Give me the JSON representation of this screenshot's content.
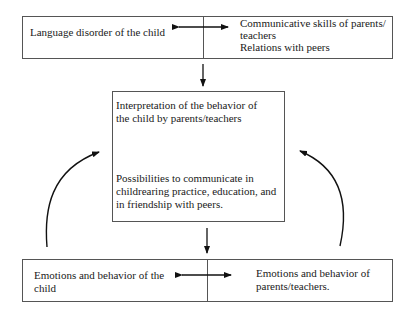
{
  "diagram": {
    "top_box": {
      "left": "Language disorder of the child",
      "right_line1": "Communicative skills of parents/",
      "right_line2": "teachers",
      "right_line3": "Relations with peers"
    },
    "middle_box": {
      "top_line1": "Interpretation of the behavior of",
      "top_line2": "the child by parents/teachers",
      "bottom_line1": "Possibilities to communicate in",
      "bottom_line2": "childrearing practice, education, and",
      "bottom_line3": "in friendship with peers."
    },
    "bottom_box": {
      "left_line1": "Emotions and behavior of the",
      "left_line2": "child",
      "right_line1": "Emotions and behavior of",
      "right_line2": "parents/teachers."
    },
    "arrows": [
      {
        "id": "top-bidirectional",
        "type": "double-headed",
        "from": "Language disorder of the child",
        "to": "Communicative skills of parents/teachers"
      },
      {
        "id": "top-to-middle",
        "type": "down"
      },
      {
        "id": "middle-to-bottom",
        "type": "down"
      },
      {
        "id": "bottom-bidirectional",
        "type": "double-headed",
        "from": "Emotions and behavior of the child",
        "to": "Emotions and behavior of parents/teachers."
      },
      {
        "id": "left-feedback",
        "type": "curved",
        "from": "Emotions and behavior of the child",
        "to": "middle box"
      },
      {
        "id": "right-feedback",
        "type": "curved",
        "from": "Emotions and behavior of parents/teachers.",
        "to": "middle box"
      }
    ]
  }
}
